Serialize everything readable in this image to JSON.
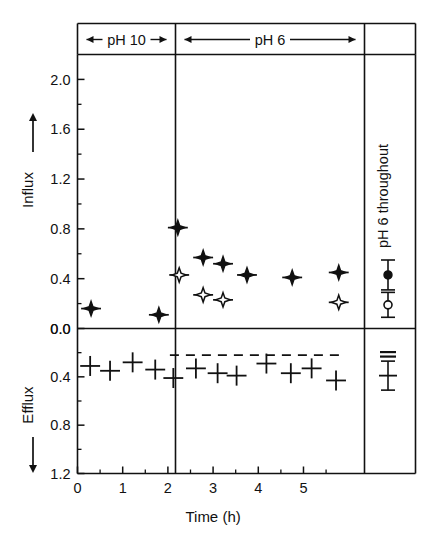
{
  "chart_data": {
    "type": "scatter",
    "title": "",
    "xlabel": "Time  (h)",
    "ylabel_top": "Influx",
    "ylabel_bottom": "Efflux",
    "xlim": [
      0,
      6.35
    ],
    "xticks": [
      0,
      1,
      2,
      3,
      4,
      5
    ],
    "xticklabels": [
      "0",
      "1",
      "2",
      "3",
      "4",
      "5"
    ],
    "x_minor_ticks": [
      0.5,
      1.5,
      2.5,
      3.5,
      4.5,
      5.5
    ],
    "influx_ylim": [
      0.0,
      2.2
    ],
    "influx_yticks": [
      0.0,
      0.4,
      0.8,
      1.2,
      1.6,
      2.0
    ],
    "influx_yticklabels": [
      "0.0",
      "0.4",
      "0.8",
      "1.2",
      "1.6",
      "2.0"
    ],
    "influx_minor_yticks": [
      0.2,
      0.6,
      1.0,
      1.4,
      1.8
    ],
    "efflux_ylim": [
      0.0,
      1.2
    ],
    "efflux_yticks": [
      0.0,
      0.4,
      0.8,
      1.2
    ],
    "efflux_yticklabels": [
      "0.0",
      "0.4",
      "0.8",
      "1.2"
    ],
    "efflux_minor_yticks": [
      0.2,
      0.6,
      1.0
    ],
    "efflux_axis_direction": "downward",
    "grid": false,
    "legend": "none",
    "bands": [
      {
        "label": "pH 10",
        "x_start": 0.0,
        "x_end": 2.0,
        "arrow": "double"
      },
      {
        "label": "pH 6",
        "x_start": 2.0,
        "x_end": 5.85,
        "arrow": "double"
      }
    ],
    "right_panel": {
      "label": "pH 6 throughout",
      "influx_filled": {
        "value": 0.43,
        "err_low": 0.12,
        "err_high": 0.12
      },
      "influx_open": {
        "value": 0.19,
        "err_low": 0.1,
        "err_high": 0.1
      },
      "efflux_dashes": {
        "value": 0.22
      },
      "efflux_cross": {
        "value": 0.39,
        "err_low": 0.12,
        "err_high": 0.12
      }
    },
    "series": [
      {
        "name": "Influx filled",
        "marker": "filled-star-circle",
        "points": [
          {
            "x": 0.3,
            "y": 0.16,
            "xerr": 0.22
          },
          {
            "x": 1.8,
            "y": 0.11,
            "xerr": 0.22
          },
          {
            "x": 2.22,
            "y": 0.81,
            "xerr": 0.22
          },
          {
            "x": 2.78,
            "y": 0.57,
            "xerr": 0.22
          },
          {
            "x": 3.22,
            "y": 0.52,
            "xerr": 0.22
          },
          {
            "x": 3.75,
            "y": 0.43,
            "xerr": 0.22
          },
          {
            "x": 4.75,
            "y": 0.41,
            "xerr": 0.22
          },
          {
            "x": 5.78,
            "y": 0.45,
            "xerr": 0.22
          }
        ]
      },
      {
        "name": "Influx open",
        "marker": "open-star-circle",
        "points": [
          {
            "x": 2.25,
            "y": 0.43,
            "xerr": 0.22
          },
          {
            "x": 2.78,
            "y": 0.27,
            "xerr": 0.22
          },
          {
            "x": 3.22,
            "y": 0.23,
            "xerr": 0.22
          },
          {
            "x": 5.78,
            "y": 0.21,
            "xerr": 0.22
          }
        ]
      },
      {
        "name": "Efflux",
        "marker": "cross",
        "points": [
          {
            "x": 0.28,
            "y": 0.31,
            "xerr": 0.22
          },
          {
            "x": 0.72,
            "y": 0.35,
            "xerr": 0.22
          },
          {
            "x": 1.22,
            "y": 0.28,
            "xerr": 0.22
          },
          {
            "x": 1.72,
            "y": 0.34,
            "xerr": 0.22
          },
          {
            "x": 2.12,
            "y": 0.41,
            "xerr": 0.22
          },
          {
            "x": 2.62,
            "y": 0.33,
            "xerr": 0.22
          },
          {
            "x": 3.1,
            "y": 0.37,
            "xerr": 0.22
          },
          {
            "x": 3.52,
            "y": 0.39,
            "xerr": 0.22
          },
          {
            "x": 4.18,
            "y": 0.29,
            "xerr": 0.22
          },
          {
            "x": 4.72,
            "y": 0.37,
            "xerr": 0.22
          },
          {
            "x": 5.18,
            "y": 0.33,
            "xerr": 0.22
          },
          {
            "x": 5.72,
            "y": 0.43,
            "xerr": 0.22
          }
        ]
      },
      {
        "name": "Efflux reference",
        "marker": "dashed-line",
        "value": 0.22,
        "x_start": 2.0,
        "x_end": 5.85
      }
    ]
  }
}
